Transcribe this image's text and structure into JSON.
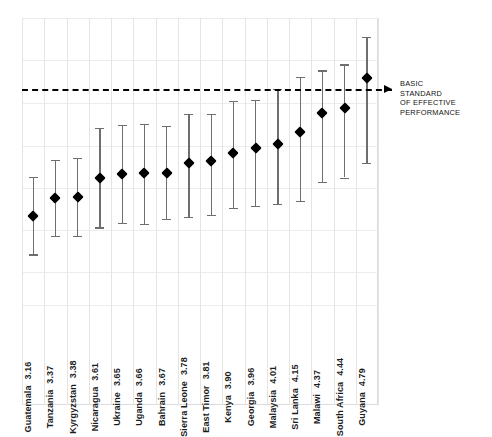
{
  "chart_data": {
    "type": "scatter",
    "title": "",
    "subtitle": "",
    "xlabel": "",
    "ylabel": "",
    "categories": [
      "Guatemala",
      "Tanzania",
      "Kyrgyzstan",
      "Nicaragua",
      "Ukraine",
      "Uganda",
      "Bahrain",
      "Sierra Leone",
      "East Timor",
      "Kenya",
      "Georgia",
      "Malaysia",
      "Sri Lanka",
      "Malawi",
      "South Africa",
      "Guyana"
    ],
    "values": [
      3.16,
      3.37,
      3.38,
      3.61,
      3.65,
      3.66,
      3.67,
      3.78,
      3.81,
      3.9,
      3.96,
      4.01,
      4.15,
      4.37,
      4.44,
      4.79
    ],
    "error_low": [
      2.7,
      2.92,
      2.92,
      3.02,
      3.07,
      3.06,
      3.12,
      3.14,
      3.17,
      3.25,
      3.27,
      3.3,
      3.33,
      3.56,
      3.61,
      3.78
    ],
    "error_high": [
      3.62,
      3.82,
      3.84,
      4.2,
      4.23,
      4.25,
      4.22,
      4.36,
      4.36,
      4.52,
      4.53,
      4.66,
      4.8,
      4.88,
      4.95,
      5.28
    ],
    "ylim": [
      2.1,
      5.5
    ],
    "grid": true,
    "legend": null,
    "marker": "diamond",
    "marker_color": "#000000",
    "errorbar_color": "#6e6e6e",
    "threshold": {
      "value": 4.66,
      "style": "dashed",
      "color": "#000000",
      "label_lines": [
        "BASIC",
        "STANDARD",
        "OF EFFECTIVE",
        "PERFORMANCE"
      ]
    },
    "gridline_values": [
      5.5,
      5.0,
      4.49,
      3.99,
      3.49,
      2.99,
      2.49,
      2.1
    ]
  },
  "annotation": {
    "line1": "BASIC",
    "line2": "STANDARD",
    "line3": "OF EFFECTIVE",
    "line4": "PERFORMANCE"
  }
}
